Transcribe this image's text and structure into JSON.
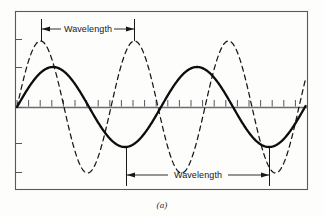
{
  "figure": {
    "caption": "(a)",
    "labels": {
      "top_wavelength": "Wavelength",
      "bottom_wavelength": "Wavelength"
    },
    "colors": {
      "frame": "#5a5a5e",
      "axis": "#6b6b70",
      "solid_wave": "#0d0d0f",
      "dashed_wave": "#17171a",
      "annotation": "#17171a",
      "background": "#fdfdfc",
      "caption": "#2a2a2a"
    },
    "frame": {
      "x": 15,
      "y": 11,
      "width": 293,
      "height": 179
    },
    "axis": {
      "baseline_y": 107,
      "x_start": 17,
      "x_end": 306
    },
    "axis_ticks": {
      "count": 25,
      "spacing": 11.6,
      "length_up": 7,
      "first_x": 17
    },
    "left_ticks_y": [
      39,
      67,
      107,
      143,
      172
    ],
    "annotations": [
      {
        "name": "top-wavelength-dimension",
        "label": "Wavelength",
        "x1": 41,
        "x2": 135,
        "y": 29,
        "tick_top": 19,
        "tick_bottom": 39
      },
      {
        "name": "bottom-wavelength-dimension",
        "label": "Wavelength",
        "x1": 126,
        "x2": 270,
        "y": 175,
        "tick_top": 148,
        "tick_bottom": 186
      }
    ]
  },
  "chart_data": {
    "type": "line",
    "title": "",
    "subtitle": "(a)",
    "xlabel": "",
    "ylabel": "",
    "grid": false,
    "legend": "none",
    "xlim": [
      17,
      306
    ],
    "ylim": [
      -1.15,
      1.15
    ],
    "baseline_y_px": 107,
    "annotations": [
      {
        "text": "Wavelength",
        "refers_to": "dashed-short-wave",
        "x_start_px": 41,
        "x_end_px": 135,
        "y_px": 29,
        "wavelength_px": 94
      },
      {
        "text": "Wavelength",
        "refers_to": "solid-long-wave",
        "x_start_px": 126,
        "x_end_px": 270,
        "y_px": 175,
        "wavelength_px": 144
      }
    ],
    "series": [
      {
        "name": "solid-long-wave",
        "style": "solid",
        "color": "#0d0d0f",
        "linewidth": 2.3,
        "amplitude_px": 40,
        "wavelength_px": 144,
        "phase_deg": 0,
        "description": "Long-wavelength sine, peaks near x=53 and x=197, troughs near x=126 and x=270",
        "peaks_px": [
          53,
          197
        ],
        "troughs_px": [
          126,
          270
        ]
      },
      {
        "name": "dashed-short-wave",
        "style": "dashed",
        "color": "#17171a",
        "linewidth": 1.25,
        "dash_pattern": "5,4",
        "amplitude_px": 66,
        "wavelength_px": 94,
        "phase_deg": 0,
        "description": "Short-wavelength sine of larger amplitude, peaks near x=41, 134, 228; troughs near x=88, 182, 275",
        "peaks_px": [
          41,
          134,
          228
        ],
        "troughs_px": [
          88,
          182,
          275
        ]
      }
    ]
  }
}
